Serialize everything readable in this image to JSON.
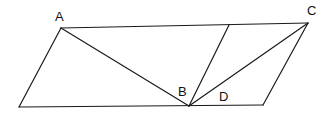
{
  "diagram": {
    "type": "geometry",
    "points": {
      "A": {
        "x": 61,
        "y": 28
      },
      "C": {
        "x": 308,
        "y": 23
      },
      "B": {
        "x": 189,
        "y": 106
      },
      "BL": {
        "x": 19,
        "y": 107
      },
      "BR": {
        "x": 263,
        "y": 105
      },
      "T": {
        "x": 229,
        "y": 25
      }
    },
    "segments": [
      {
        "name": "segment-a-c",
        "from": "A",
        "to": "C"
      },
      {
        "name": "segment-bl-br",
        "from": "BL",
        "to": "BR"
      },
      {
        "name": "segment-bl-a",
        "from": "BL",
        "to": "A"
      },
      {
        "name": "segment-c-br",
        "from": "C",
        "to": "BR"
      },
      {
        "name": "segment-a-b",
        "from": "A",
        "to": "B"
      },
      {
        "name": "segment-b-c",
        "from": "B",
        "to": "C"
      },
      {
        "name": "segment-b-t",
        "from": "B",
        "to": "T"
      }
    ],
    "labels": [
      {
        "name": "label-a",
        "text": "A",
        "x": 55,
        "y": 21
      },
      {
        "name": "label-c",
        "text": "C",
        "x": 307,
        "y": 15
      },
      {
        "name": "label-b",
        "text": "B",
        "x": 178,
        "y": 96
      },
      {
        "name": "label-d",
        "text": "D",
        "x": 219,
        "y": 101
      }
    ],
    "stroke_color": "#1a1a1a",
    "background": "#ffffff"
  }
}
